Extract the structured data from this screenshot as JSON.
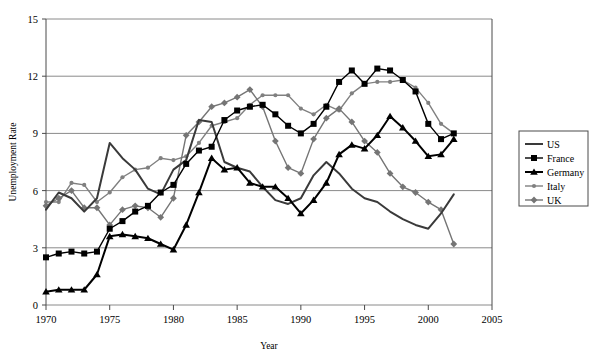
{
  "chart_data": {
    "type": "line",
    "title": "",
    "xlabel": "Year",
    "ylabel": "Unemployment Rate",
    "xlim": [
      1970,
      2005
    ],
    "ylim": [
      0,
      15
    ],
    "xticks": [
      1970,
      1975,
      1980,
      1985,
      1990,
      1995,
      2000,
      2005
    ],
    "yticks": [
      0,
      3,
      6,
      9,
      12,
      15
    ],
    "grid": "horizontal",
    "legend_position": "right-outside",
    "x": [
      1970,
      1971,
      1972,
      1973,
      1974,
      1975,
      1976,
      1977,
      1978,
      1979,
      1980,
      1981,
      1982,
      1983,
      1984,
      1985,
      1986,
      1987,
      1988,
      1989,
      1990,
      1991,
      1992,
      1993,
      1994,
      1995,
      1996,
      1997,
      1998,
      1999,
      2000,
      2001,
      2002
    ],
    "series": [
      {
        "name": "US",
        "color": "#3a3a3a",
        "marker": "none",
        "values": [
          5.0,
          5.9,
          5.6,
          4.9,
          5.6,
          8.5,
          7.7,
          7.1,
          6.1,
          5.8,
          7.1,
          7.6,
          9.7,
          9.6,
          7.5,
          7.2,
          7.0,
          6.2,
          5.5,
          5.3,
          5.6,
          6.8,
          7.5,
          6.9,
          6.1,
          5.6,
          5.4,
          4.9,
          4.5,
          4.2,
          4.0,
          4.8,
          5.8
        ]
      },
      {
        "name": "France",
        "color": "#000000",
        "marker": "square",
        "values": [
          2.5,
          2.7,
          2.8,
          2.7,
          2.8,
          4.0,
          4.4,
          4.9,
          5.2,
          5.9,
          6.3,
          7.4,
          8.1,
          8.3,
          9.7,
          10.2,
          10.4,
          10.5,
          10.0,
          9.4,
          9.0,
          9.5,
          10.4,
          11.7,
          12.3,
          11.6,
          12.4,
          12.3,
          11.8,
          11.2,
          9.5,
          8.7,
          9.0
        ]
      },
      {
        "name": "Germany",
        "color": "#000000",
        "marker": "triangle",
        "values": [
          0.7,
          0.8,
          0.8,
          0.8,
          1.6,
          3.6,
          3.7,
          3.6,
          3.5,
          3.2,
          2.9,
          4.2,
          5.9,
          7.7,
          7.1,
          7.2,
          6.4,
          6.2,
          6.2,
          5.6,
          4.8,
          5.5,
          6.4,
          7.9,
          8.4,
          8.2,
          8.9,
          9.9,
          9.3,
          8.6,
          7.8,
          7.9,
          8.7
        ]
      },
      {
        "name": "Italy",
        "color": "#808080",
        "marker": "dot",
        "values": [
          5.4,
          5.4,
          6.4,
          6.3,
          5.4,
          5.9,
          6.7,
          7.1,
          7.2,
          7.7,
          7.6,
          7.8,
          8.5,
          9.4,
          9.6,
          9.8,
          10.5,
          11.0,
          11.0,
          11.0,
          10.3,
          10.0,
          10.5,
          10.2,
          11.1,
          11.6,
          11.7,
          11.7,
          11.8,
          11.4,
          10.6,
          9.5,
          9.0
        ]
      },
      {
        "name": "UK",
        "color": "#757575",
        "marker": "diamond",
        "values": [
          5.2,
          5.6,
          6.0,
          5.1,
          5.1,
          4.2,
          5.0,
          5.2,
          5.1,
          4.6,
          5.6,
          8.9,
          9.6,
          10.4,
          10.6,
          10.9,
          11.3,
          10.4,
          8.6,
          7.2,
          6.9,
          8.7,
          9.8,
          10.3,
          9.6,
          8.6,
          8.0,
          6.9,
          6.2,
          5.9,
          5.4,
          5.0,
          3.2
        ]
      }
    ]
  },
  "legend": {
    "items": [
      {
        "label": "US"
      },
      {
        "label": "France"
      },
      {
        "label": "Germany"
      },
      {
        "label": "Italy"
      },
      {
        "label": "UK"
      }
    ]
  },
  "axes": {
    "x_tick_labels": [
      "1970",
      "1975",
      "1980",
      "1985",
      "1990",
      "1995",
      "2000",
      "2005"
    ],
    "y_tick_labels": [
      "0",
      "3",
      "6",
      "9",
      "12",
      "15"
    ],
    "x_title": "Year",
    "y_title": "Unemployment Rate"
  }
}
